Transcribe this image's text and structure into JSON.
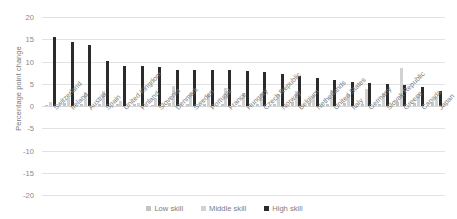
{
  "chart_data": {
    "type": "bar",
    "title": "",
    "xlabel": "",
    "ylabel": "Percentage point change",
    "ylim": [
      -20,
      20
    ],
    "ytick_labels": [
      "20",
      "15",
      "10",
      "5",
      "0",
      "-5",
      "-10",
      "-15",
      "-20"
    ],
    "yticks": [
      20,
      15,
      10,
      5,
      0,
      -5,
      -10,
      -15,
      -20
    ],
    "grid": true,
    "legend_position": "bottom",
    "categories": [
      "Switzerland",
      "Ireland",
      "Austria",
      "Spain",
      "United Kingdom",
      "Finland",
      "Slovenia",
      "Denmark",
      "Sweden",
      "Portugal",
      "France",
      "Hungary",
      "Czech Republic",
      "Norway",
      "Belgium",
      "Netherlands",
      "United States",
      "Italy",
      "Germany",
      "Slovak Republic",
      "Greece",
      "Canada",
      "Japan"
    ],
    "series": [
      {
        "name": "Low skill",
        "color": "#c4c4c4",
        "values": [
          0.3,
          0.6,
          0.4,
          0.5,
          0.4,
          0.5,
          0.3,
          0.6,
          0.5,
          0.5,
          0.4,
          0.3,
          0.4,
          0.5,
          0.8,
          0.6,
          0.5,
          0.6,
          0.5,
          0.5,
          0.9,
          0.7,
          0.8
        ]
      },
      {
        "name": "Middle skill",
        "color": "#d2d2d2",
        "values": [
          0.8,
          1.9,
          3.0,
          3.4,
          1.2,
          0.7,
          1.7,
          4.4,
          2.9,
          2.8,
          4.0,
          3.0,
          2.9,
          2.7,
          3.4,
          2.4,
          3.5,
          2.6,
          3.8,
          3.0,
          8.6,
          2.8,
          2.1
        ]
      },
      {
        "name": "High skill",
        "color": "#2b2b2b",
        "values": [
          15.6,
          14.4,
          13.8,
          10.2,
          9.1,
          8.9,
          8.8,
          8.2,
          8.0,
          8.0,
          8.0,
          7.8,
          7.6,
          7.2,
          6.7,
          6.2,
          5.9,
          5.5,
          5.2,
          4.9,
          4.7,
          4.2,
          3.3
        ]
      }
    ]
  },
  "legend": {
    "items": [
      {
        "label": "Low skill"
      },
      {
        "label": "Middle skill"
      },
      {
        "label": "High skill"
      }
    ]
  }
}
